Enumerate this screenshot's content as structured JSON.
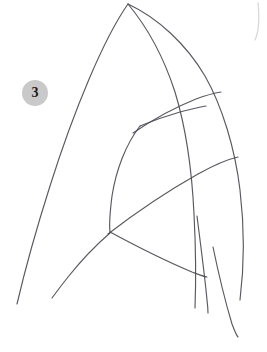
{
  "figure": {
    "label": {
      "text": "3",
      "name": "figure-number-badge",
      "background_color": "#c9c9c9",
      "text_color": "#1a1a1a",
      "x": 22,
      "y": 80,
      "diameter": 26
    },
    "canvas": {
      "width": 267,
      "height": 352,
      "background_color": "#ffffff"
    },
    "medium": "pencil-line-drawing",
    "stroke_color": "#4a4a52",
    "faint_stroke_color": "#b9b9c0",
    "strokes": [
      {
        "name": "outer-left-arch-curve",
        "d": "M 128 4 C 104 38 74 110 50 186 C 36 230 24 274 17 304"
      },
      {
        "name": "outer-right-arch-curve",
        "d": "M 128 4 C 158 18 186 44 205 76 C 222 106 235 148 240 190 C 245 232 244 268 240 300"
      },
      {
        "name": "inner-right-rib-curve",
        "d": "M 128 4 C 148 28 164 58 175 92 C 186 128 192 172 194 214 C 196 252 196 282 195 308"
      },
      {
        "name": "upper-band-curve",
        "d": "M 133 133 C 152 120 176 107 196 99 C 207 95 215 93 221 92"
      },
      {
        "name": "lower-band-curve",
        "d": "M 108 234 C 134 214 166 192 198 174 C 216 164 229 159 238 157"
      },
      {
        "name": "inner-panel-left-edge",
        "d": "M 140 126 C 126 144 116 170 112 196 C 110 212 109 224 110 232"
      },
      {
        "name": "inner-panel-top-edge",
        "d": "M 140 126 C 152 121 166 116 180 112 C 192 109 200 107 206 106"
      },
      {
        "name": "inner-panel-bottom-edge",
        "d": "M 110 232 C 136 246 168 262 192 272 C 200 275 205 277 207 277"
      },
      {
        "name": "lower-left-diagonal",
        "d": "M 110 233 C 96 245 80 262 68 277 C 60 287 55 294 52 298"
      },
      {
        "name": "bottom-right-vertical-inner",
        "d": "M 197 216 C 201 248 205 278 207 300 C 208 308 208 312 208 313"
      },
      {
        "name": "bottom-right-vertical-outer",
        "d": "M 213 247 C 219 276 226 304 232 324 C 235 332 237 336 238 337"
      },
      {
        "name": "faint-top-right-arc",
        "d": "M 258 3 C 259 12 259 22 258 30 C 257 35 256 38 255 40",
        "faint": true
      }
    ]
  }
}
